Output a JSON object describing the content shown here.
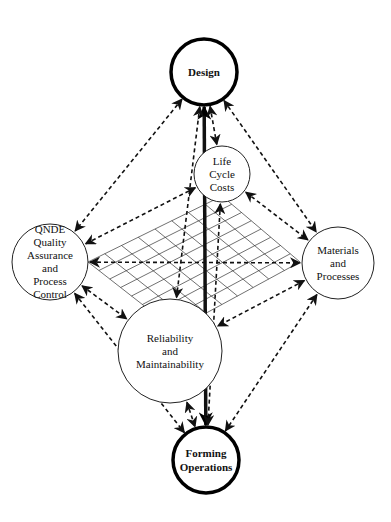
{
  "diagram": {
    "nodes": [
      {
        "id": "design",
        "lines": [
          "Design"
        ],
        "cx": 204,
        "cy": 72,
        "r": 33,
        "style": "thick"
      },
      {
        "id": "life_cycle_costs",
        "lines": [
          "Life",
          "Cycle",
          "Costs"
        ],
        "cx": 222,
        "cy": 174,
        "r": 28,
        "style": "thin"
      },
      {
        "id": "qnde",
        "lines": [
          "QNDE",
          "Quality",
          "Assurance",
          "and",
          "Process",
          "Control"
        ],
        "cx": 50,
        "cy": 262,
        "r": 38,
        "style": "thin"
      },
      {
        "id": "materials",
        "lines": [
          "Materials",
          "and",
          "Processes"
        ],
        "cx": 338,
        "cy": 263,
        "r": 36,
        "style": "thin"
      },
      {
        "id": "reliability",
        "lines": [
          "Reliability",
          "and",
          "Maintainability"
        ],
        "cx": 170,
        "cy": 351,
        "r": 52,
        "style": "thin"
      },
      {
        "id": "forming",
        "lines": [
          "Forming",
          "Operations"
        ],
        "cx": 206,
        "cy": 460,
        "r": 33,
        "style": "thick"
      }
    ],
    "edges": [
      {
        "from": "design",
        "to": "forming",
        "style": "solid",
        "arrows": "both"
      },
      {
        "from": "design",
        "to": "life_cycle_costs",
        "style": "dashed",
        "arrows": "both"
      },
      {
        "from": "design",
        "to": "qnde",
        "style": "dashed",
        "arrows": "both"
      },
      {
        "from": "design",
        "to": "materials",
        "style": "dashed",
        "arrows": "both"
      },
      {
        "from": "design",
        "to": "reliability",
        "style": "dashed",
        "arrows": "both"
      },
      {
        "from": "life_cycle_costs",
        "to": "qnde",
        "style": "dashed",
        "arrows": "both"
      },
      {
        "from": "life_cycle_costs",
        "to": "materials",
        "style": "dashed",
        "arrows": "both"
      },
      {
        "from": "life_cycle_costs",
        "to": "forming",
        "style": "dashed",
        "arrows": "both"
      },
      {
        "from": "qnde",
        "to": "materials",
        "style": "dashed",
        "arrows": "both"
      },
      {
        "from": "qnde",
        "to": "reliability",
        "style": "dashed",
        "arrows": "both"
      },
      {
        "from": "qnde",
        "to": "forming",
        "style": "dashed",
        "arrows": "both"
      },
      {
        "from": "materials",
        "to": "reliability",
        "style": "dashed",
        "arrows": "both"
      },
      {
        "from": "materials",
        "to": "forming",
        "style": "dashed",
        "arrows": "both"
      },
      {
        "from": "reliability",
        "to": "forming",
        "style": "dashed",
        "arrows": "both"
      }
    ],
    "grid": {
      "left": [
        88,
        262
      ],
      "top": [
        222,
        196
      ],
      "right": [
        300,
        262
      ],
      "bottom": [
        175,
        330
      ],
      "divisions": 8
    }
  }
}
